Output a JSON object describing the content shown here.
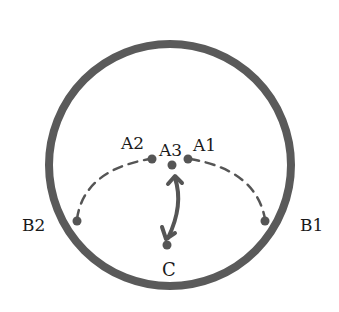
{
  "diagram": {
    "colors": {
      "circle": "#5a5a5a",
      "path": "#555555",
      "text": "#1a1a1a"
    },
    "circle": {
      "cx": 170,
      "cy": 165,
      "r": 121,
      "stroke_width": 8
    },
    "labels": {
      "a1": "A1",
      "a2": "A2",
      "a3": "A3",
      "b1": "B1",
      "b2": "B2",
      "c": "C"
    },
    "points": {
      "a1": {
        "x": 188,
        "y": 159
      },
      "a2": {
        "x": 152,
        "y": 159
      },
      "a3": {
        "x": 172,
        "y": 165
      },
      "b1": {
        "x": 265,
        "y": 221
      },
      "b2": {
        "x": 77,
        "y": 221
      },
      "c": {
        "x": 167,
        "y": 247
      }
    }
  }
}
